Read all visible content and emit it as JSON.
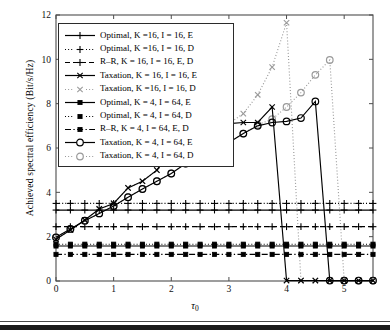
{
  "chart_data": {
    "type": "line",
    "title": "",
    "xlabel": "τ₀",
    "ylabel": "Achieved spectral efficiency (Bit/s/Hz)",
    "xlim": [
      0,
      5.5
    ],
    "ylim": [
      0,
      12
    ],
    "xticks": [
      0,
      1,
      2,
      3,
      4,
      5
    ],
    "yticks": [
      0,
      2,
      4,
      6,
      8,
      10,
      12
    ],
    "xticklabels": [
      "0",
      "1",
      "2",
      "3",
      "4",
      "5"
    ],
    "yticklabels": [
      "0",
      "2",
      "4",
      "6",
      "8",
      "10",
      "12"
    ],
    "grid": false,
    "legend_position": "upper left",
    "series": [
      {
        "name": "Optimal, K =16, I = 16, E",
        "label_parts": {
          "method": "Optimal",
          "K": "16",
          "I": "16",
          "mode": "E"
        },
        "marker": "plus",
        "linestyle": "solid",
        "color": "#000000",
        "x": [
          0,
          0.25,
          0.5,
          0.75,
          1.0,
          1.25,
          1.5,
          1.75,
          2.0,
          2.25,
          2.5,
          2.75,
          3.0,
          3.25,
          3.5,
          3.75,
          4.0,
          4.25,
          4.5,
          4.75,
          5.0,
          5.25,
          5.5
        ],
        "y": [
          3.2,
          3.2,
          3.2,
          3.2,
          3.2,
          3.2,
          3.2,
          3.2,
          3.2,
          3.2,
          3.2,
          3.2,
          3.2,
          3.2,
          3.2,
          3.2,
          3.2,
          3.2,
          3.2,
          3.2,
          3.2,
          3.2,
          3.2
        ]
      },
      {
        "name": "Optimal, K =16, I = 16, D",
        "label_parts": {
          "method": "Optimal",
          "K": "16",
          "I": "16",
          "mode": "D"
        },
        "marker": "plus",
        "linestyle": "dotted",
        "color": "#000000",
        "x": [
          0,
          0.25,
          0.5,
          0.75,
          1.0,
          1.25,
          1.5,
          1.75,
          2.0,
          2.25,
          2.5,
          2.75,
          3.0,
          3.25,
          3.5,
          3.75,
          4.0,
          4.25,
          4.5,
          4.75,
          5.0,
          5.25,
          5.5
        ],
        "y": [
          3.5,
          3.5,
          3.5,
          3.5,
          3.5,
          3.5,
          3.5,
          3.5,
          3.5,
          3.5,
          3.5,
          3.5,
          3.5,
          3.5,
          3.5,
          3.5,
          3.5,
          3.5,
          3.5,
          3.5,
          3.5,
          3.5,
          3.5
        ]
      },
      {
        "name": "R–R, K = 16, I = 16, E, D",
        "label_parts": {
          "method": "R–R",
          "K": "16",
          "I": "16",
          "mode": "E, D"
        },
        "marker": "plus",
        "linestyle": "dashed",
        "color": "#000000",
        "x": [
          0,
          0.25,
          0.5,
          0.75,
          1.0,
          1.25,
          1.5,
          1.75,
          2.0,
          2.25,
          2.5,
          2.75,
          3.0,
          3.25,
          3.5,
          3.75,
          4.0,
          4.25,
          4.5,
          4.75,
          5.0,
          5.25,
          5.5
        ],
        "y": [
          2.45,
          2.45,
          2.45,
          2.45,
          2.45,
          2.45,
          2.45,
          2.45,
          2.45,
          2.45,
          2.45,
          2.45,
          2.45,
          2.45,
          2.45,
          2.45,
          2.45,
          2.45,
          2.45,
          2.45,
          2.45,
          2.45,
          2.45
        ]
      },
      {
        "name": "Taxation, K = 16, I = 16, E",
        "label_parts": {
          "method": "Taxation",
          "K": "16",
          "I": "16",
          "mode": "E"
        },
        "marker": "cross",
        "linestyle": "solid",
        "color": "#000000",
        "x": [
          0,
          0.25,
          0.5,
          0.75,
          1.0,
          1.25,
          1.5,
          1.75,
          2.0,
          2.25,
          2.5,
          2.75,
          3.0,
          3.25,
          3.5,
          3.75,
          4.0,
          4.25,
          4.5,
          4.75,
          5.0,
          5.25,
          5.5
        ],
        "y": [
          1.88,
          2.3,
          2.75,
          3.25,
          3.5,
          4.2,
          4.5,
          5.0,
          5.95,
          5.95,
          5.95,
          6.65,
          7.1,
          7.15,
          7.15,
          7.85,
          0.02,
          0.02,
          0.02,
          0.02,
          0.02,
          0.02,
          0.02
        ]
      },
      {
        "name": "Taxation, K =16, I = 16, D",
        "label_parts": {
          "method": "Taxation",
          "K": "16",
          "I": "16",
          "mode": "D"
        },
        "marker": "cross",
        "linestyle": "dotted",
        "color": "#9a9a9a",
        "x": [
          0,
          0.25,
          0.5,
          0.75,
          1.0,
          1.25,
          1.5,
          1.75,
          2.0,
          2.25,
          2.5,
          2.75,
          3.0,
          3.25,
          3.5,
          3.75,
          4.0,
          4.25,
          4.5,
          4.75,
          5.0,
          5.25,
          5.5
        ],
        "y": [
          1.88,
          2.3,
          2.75,
          3.25,
          3.5,
          4.2,
          4.5,
          5.0,
          5.95,
          5.95,
          5.95,
          6.65,
          7.1,
          7.55,
          8.4,
          9.65,
          11.65,
          0.02,
          0.02,
          0.02,
          0.02,
          0.02,
          0.02
        ]
      },
      {
        "name": "Optimal, K = 4, I = 64, E",
        "label_parts": {
          "method": "Optimal",
          "K": "4",
          "I": "64",
          "mode": "E"
        },
        "marker": "square",
        "linestyle": "solid",
        "color": "#000000",
        "x": [
          0,
          0.25,
          0.5,
          0.75,
          1.0,
          1.25,
          1.5,
          1.75,
          2.0,
          2.25,
          2.5,
          2.75,
          3.0,
          3.25,
          3.5,
          3.75,
          4.0,
          4.25,
          4.5,
          4.75,
          5.0,
          5.25,
          5.5
        ],
        "y": [
          1.58,
          1.58,
          1.58,
          1.58,
          1.58,
          1.58,
          1.58,
          1.58,
          1.58,
          1.58,
          1.58,
          1.58,
          1.58,
          1.58,
          1.58,
          1.58,
          1.58,
          1.58,
          1.58,
          1.58,
          1.58,
          1.58,
          1.58
        ]
      },
      {
        "name": "Optimal, K = 4, I = 64, D",
        "label_parts": {
          "method": "Optimal",
          "K": "4",
          "I": "64",
          "mode": "D"
        },
        "marker": "square",
        "linestyle": "dotted",
        "color": "#000000",
        "x": [
          0,
          0.25,
          0.5,
          0.75,
          1.0,
          1.25,
          1.5,
          1.75,
          2.0,
          2.25,
          2.5,
          2.75,
          3.0,
          3.25,
          3.5,
          3.75,
          4.0,
          4.25,
          4.5,
          4.75,
          5.0,
          5.25,
          5.5
        ],
        "y": [
          1.66,
          1.66,
          1.66,
          1.66,
          1.66,
          1.66,
          1.66,
          1.66,
          1.66,
          1.66,
          1.66,
          1.66,
          1.66,
          1.66,
          1.66,
          1.66,
          1.66,
          1.66,
          1.66,
          1.66,
          1.66,
          1.66,
          1.66
        ]
      },
      {
        "name": "R–R, K = 4, I = 64, E, D",
        "label_parts": {
          "method": "R–R",
          "K": "4",
          "I": "64",
          "mode": "E, D"
        },
        "marker": "square",
        "linestyle": "dashdot",
        "color": "#000000",
        "x": [
          0,
          0.25,
          0.5,
          0.75,
          1.0,
          1.25,
          1.5,
          1.75,
          2.0,
          2.25,
          2.5,
          2.75,
          3.0,
          3.25,
          3.5,
          3.75,
          4.0,
          4.25,
          4.5,
          4.75,
          5.0,
          5.25,
          5.5
        ],
        "y": [
          1.2,
          1.2,
          1.2,
          1.2,
          1.2,
          1.2,
          1.2,
          1.2,
          1.2,
          1.2,
          1.2,
          1.2,
          1.2,
          1.2,
          1.2,
          1.2,
          1.2,
          1.2,
          1.2,
          1.2,
          1.2,
          1.2,
          1.2
        ]
      },
      {
        "name": "Taxation, K = 4, I = 64, E",
        "label_parts": {
          "method": "Taxation",
          "K": "4",
          "I": "64",
          "mode": "E"
        },
        "marker": "circle",
        "linestyle": "solid",
        "color": "#000000",
        "x": [
          0,
          0.25,
          0.5,
          0.75,
          1.0,
          1.25,
          1.5,
          1.75,
          2.0,
          2.25,
          2.5,
          2.75,
          3.0,
          3.25,
          3.5,
          3.75,
          4.0,
          4.25,
          4.5,
          4.75,
          5.0,
          5.25,
          5.5
        ],
        "y": [
          1.97,
          2.35,
          2.72,
          3.05,
          3.38,
          3.78,
          4.15,
          4.5,
          4.85,
          5.3,
          5.6,
          5.95,
          6.25,
          6.65,
          7.0,
          7.15,
          7.2,
          7.35,
          8.1,
          0.02,
          0.02,
          0.02,
          0.02
        ]
      },
      {
        "name": "Taxation, K = 4, I = 64, D",
        "label_parts": {
          "method": "Taxation",
          "K": "4",
          "I": "64",
          "mode": "D"
        },
        "marker": "circle",
        "linestyle": "dotted",
        "color": "#9a9a9a",
        "x": [
          0,
          0.25,
          0.5,
          0.75,
          1.0,
          1.25,
          1.5,
          1.75,
          2.0,
          2.25,
          2.5,
          2.75,
          3.0,
          3.25,
          3.5,
          3.75,
          4.0,
          4.25,
          4.5,
          4.75,
          5.0,
          5.25,
          5.5
        ],
        "y": [
          1.97,
          2.35,
          2.72,
          3.05,
          3.38,
          3.78,
          4.15,
          4.5,
          4.85,
          5.3,
          5.6,
          5.95,
          6.25,
          6.65,
          7.05,
          7.3,
          7.85,
          8.5,
          9.3,
          9.97,
          0.02,
          0.02,
          0.02
        ]
      }
    ]
  },
  "legend": {
    "items": [
      {
        "text": "Optimal, K =16, I = 16, E"
      },
      {
        "text": "Optimal, K =16, I = 16, D"
      },
      {
        "text": "R–R, K = 16, I = 16, E, D"
      },
      {
        "text": "Taxation, K = 16, I = 16, E"
      },
      {
        "text": "Taxation, K =16, I = 16, D"
      },
      {
        "text": "Optimal, K = 4, I = 64, E"
      },
      {
        "text": "Optimal, K = 4, I = 64, D"
      },
      {
        "text": "R–R, K = 4, I = 64, E, D"
      },
      {
        "text": "Taxation, K = 4, I = 64, E"
      },
      {
        "text": "Taxation, K = 4, I = 64, D"
      }
    ]
  },
  "axes": {
    "ylabel": "Achieved spectral efficiency (Bit/s/Hz)",
    "xlabel_main": "τ",
    "xlabel_sub": "0"
  },
  "colors": {
    "line": "#000000",
    "dotted_gray": "#9a9a9a",
    "axis": "#4d4d4d",
    "background": "#ffffff"
  }
}
